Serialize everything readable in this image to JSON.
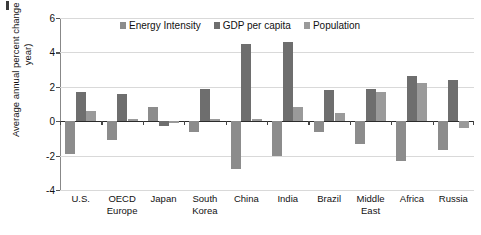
{
  "chart_data": {
    "type": "bar",
    "title": "",
    "xlabel": "",
    "ylabel": "Average annual percent change (% per year)",
    "ylim": [
      -4,
      6
    ],
    "yticks": [
      6,
      4,
      2,
      0,
      -2,
      -4
    ],
    "ytick_labels": [
      "6",
      "4",
      "2",
      "0",
      "-2",
      "-4"
    ],
    "grid": true,
    "legend_position": "top-center",
    "categories": [
      "U.S.",
      "OECD Europe",
      "Japan",
      "South Korea",
      "China",
      "India",
      "Brazil",
      "Middle East",
      "Africa",
      "Russia"
    ],
    "category_lines": [
      [
        "U.S."
      ],
      [
        "OECD",
        "Europe"
      ],
      [
        "Japan"
      ],
      [
        "South",
        "Korea"
      ],
      [
        "China"
      ],
      [
        "India"
      ],
      [
        "Brazil"
      ],
      [
        "Middle",
        "East"
      ],
      [
        "Africa"
      ],
      [
        "Russia"
      ]
    ],
    "series": [
      {
        "name": "Energy Intensity",
        "color": "#8c8c8c",
        "values": [
          -1.9,
          -1.1,
          0.85,
          -0.6,
          -2.8,
          -2.0,
          -0.6,
          -1.3,
          -2.3,
          -1.7
        ]
      },
      {
        "name": "GDP per capita",
        "color": "#6e6e6e",
        "values": [
          1.7,
          1.6,
          -0.3,
          1.9,
          4.5,
          4.6,
          1.8,
          1.9,
          2.6,
          2.4
        ]
      },
      {
        "name": "Population",
        "color": "#9a9a9a",
        "values": [
          0.6,
          0.1,
          -0.1,
          0.1,
          0.1,
          0.8,
          0.5,
          1.7,
          2.2,
          -0.4
        ]
      }
    ]
  },
  "axis": {
    "y_title": "Average annual percent change (% per year)"
  }
}
